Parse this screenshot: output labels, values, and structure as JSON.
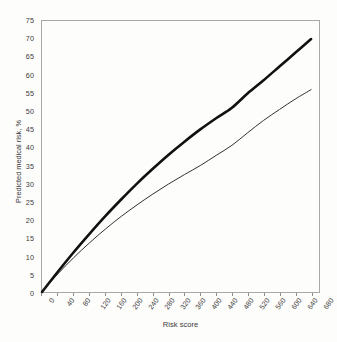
{
  "chart_data": {
    "type": "line",
    "title": "",
    "xlabel": "Risk score",
    "ylabel": "Predicted medical risk, %",
    "xlim": [
      0,
      700
    ],
    "ylim": [
      0,
      75
    ],
    "grid": false,
    "legend_position": "none",
    "x_ticks": [
      0,
      40,
      80,
      120,
      160,
      200,
      240,
      280,
      320,
      360,
      400,
      440,
      480,
      520,
      560,
      600,
      640,
      680
    ],
    "y_ticks": [
      0,
      5,
      10,
      15,
      20,
      25,
      30,
      35,
      40,
      45,
      50,
      55,
      60,
      65,
      70,
      75
    ],
    "x": [
      0,
      40,
      80,
      120,
      160,
      200,
      240,
      280,
      320,
      360,
      400,
      440,
      480,
      520,
      560,
      600,
      640,
      680
    ],
    "series": [
      {
        "name": "upper-curve",
        "style": "thick-solid-black",
        "color": "#111111",
        "linewidth": 2.6,
        "values": [
          0,
          5.6,
          11.0,
          16.1,
          21.0,
          25.6,
          30.0,
          34.1,
          38.0,
          41.6,
          45.0,
          48.1,
          51.0,
          55.0,
          58.6,
          62.4,
          66.2,
          70.0
        ]
      },
      {
        "name": "lower-curve",
        "style": "thin-solid-black",
        "color": "#1a1a1a",
        "linewidth": 0.9,
        "values": [
          0,
          5.0,
          9.5,
          13.6,
          17.4,
          20.9,
          24.1,
          27.1,
          29.9,
          32.5,
          35.0,
          37.8,
          40.6,
          44.1,
          47.5,
          50.5,
          53.4,
          56.0
        ]
      }
    ],
    "annotations": []
  },
  "axes": {
    "y_axis_title": "Predicted medical risk, %",
    "x_axis_title": "Risk score"
  },
  "colors": {
    "background": "#fdfdfc",
    "frame": "#a8a8a8",
    "tick_text": "#3a3a3a",
    "curve_thick": "#111111",
    "curve_thin": "#1a1a1a"
  }
}
